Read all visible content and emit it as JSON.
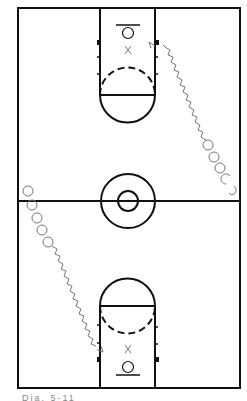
{
  "diagram": {
    "colors": {
      "lines": "#111111",
      "players": "#777777",
      "background": "#ffffff"
    },
    "court": {
      "left": 18,
      "top": 8,
      "right": 240,
      "bottom": 388,
      "center_line_y": 201
    },
    "center_circle": {
      "cx": 128,
      "cy": 201,
      "outer_r": 27,
      "inner_r": 10
    },
    "top_key": {
      "x1": 100,
      "x2": 155,
      "y_top": 8,
      "free_throw_y": 95,
      "circle_cx": 128,
      "circle_r": 27
    },
    "bottom_key": {
      "x1": 100,
      "x2": 155,
      "y_bottom": 388,
      "free_throw_y": 306,
      "circle_cx": 128,
      "circle_r": 27
    },
    "markers": [
      {
        "label": "X",
        "x": 128,
        "y": 50,
        "role": "defender-top"
      },
      {
        "label": "X",
        "x": 128,
        "y": 349,
        "role": "defender-bottom"
      }
    ],
    "players_top_right": [
      {
        "cx": 208,
        "cy": 144
      },
      {
        "cx": 214,
        "cy": 156
      },
      {
        "cx": 220,
        "cy": 167
      },
      {
        "cx": 226,
        "cy": 178
      },
      {
        "cx": 232,
        "cy": 190
      }
    ],
    "players_bottom_left": [
      {
        "cx": 28,
        "cy": 190
      },
      {
        "cx": 32,
        "cy": 204
      },
      {
        "cx": 37,
        "cy": 217
      },
      {
        "cx": 42,
        "cy": 229
      },
      {
        "cx": 48,
        "cy": 241
      }
    ],
    "caption": "Dia. 5-11"
  }
}
